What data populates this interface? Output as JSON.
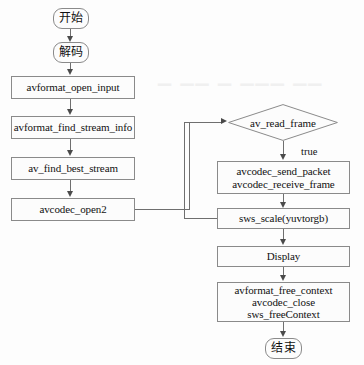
{
  "diagram": {
    "colors": {
      "background": "#fdfdfd",
      "node_fill": "#fcfcfc",
      "node_border": "#8a8a8a",
      "connector": "#6f6f6f",
      "arrow": "#4a4a4a",
      "text": "#111111"
    },
    "nodes": {
      "start": {
        "label": "开始",
        "shape": "terminal"
      },
      "decode": {
        "label": "解码",
        "shape": "terminal"
      },
      "open_input": {
        "label": "avformat_open_input",
        "shape": "process"
      },
      "find_stream_info": {
        "label": "avformat_find_stream_info",
        "shape": "process"
      },
      "find_best_stream": {
        "label": "av_find_best_stream",
        "shape": "process"
      },
      "codec_open": {
        "label": "avcodec_open2",
        "shape": "process"
      },
      "read_frame": {
        "label": "av_read_frame",
        "shape": "decision"
      },
      "send_receive": {
        "shape": "process",
        "lines": [
          "avcodec_send_packet",
          "avcodec_receive_frame"
        ]
      },
      "sws_scale": {
        "label": "sws_scale(yuvtorgb)",
        "shape": "process"
      },
      "display": {
        "label": "Display",
        "shape": "process"
      },
      "cleanup": {
        "shape": "process",
        "lines": [
          "avformat_free_context",
          "avcodec_close",
          "sws_freeContext"
        ]
      },
      "end": {
        "label": "结束",
        "shape": "terminal"
      }
    },
    "edge_labels": {
      "read_frame_true": "true"
    }
  }
}
